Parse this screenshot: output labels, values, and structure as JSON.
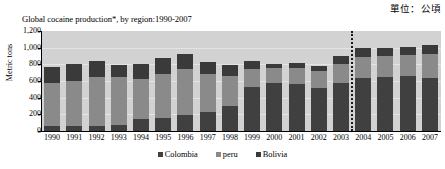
{
  "unit_note": "單位：公頃",
  "chart_data": {
    "type": "bar",
    "subtype": "stacked-bar",
    "title": "Global cocaine production*, by region:1990-2007",
    "xlabel": "",
    "ylabel": "Metric tons",
    "ylim": [
      0,
      1200
    ],
    "ytick_values": [
      0,
      200,
      400,
      600,
      800,
      1000,
      1200
    ],
    "ytick_labels": [
      "0",
      "200",
      "400",
      "600",
      "800",
      "1,000",
      "1,200"
    ],
    "grid": true,
    "legend_position": "bottom",
    "categories": [
      "1990",
      "1991",
      "1992",
      "1993",
      "1994",
      "1995",
      "1996",
      "1997",
      "1998",
      "1999",
      "2000",
      "2001",
      "2002",
      "2003",
      "2004",
      "2005",
      "2006",
      "2007"
    ],
    "series": [
      {
        "name": "Colombia",
        "color": "#404040",
        "values": [
          60,
          60,
          65,
          70,
          140,
          160,
          190,
          230,
          300,
          530,
          580,
          570,
          520,
          580,
          640,
          650,
          660,
          640
        ]
      },
      {
        "name": "peru",
        "color": "#8a8a8a",
        "values": [
          520,
          545,
          580,
          575,
          480,
          525,
          555,
          460,
          360,
          220,
          180,
          190,
          200,
          220,
          250,
          250,
          250,
          290
        ]
      },
      {
        "name": "Bolivia",
        "color": "#3a3a3a",
        "values": [
          190,
          200,
          195,
          145,
          180,
          190,
          175,
          140,
          130,
          90,
          50,
          60,
          60,
          100,
          110,
          100,
          100,
          100
        ]
      }
    ],
    "totals": [
      770,
      805,
      840,
      790,
      800,
      875,
      920,
      830,
      790,
      840,
      810,
      820,
      780,
      900,
      1000,
      1000,
      1010,
      1030
    ],
    "annotations": [
      {
        "type": "vertical-dotted-line",
        "name": "methodology-break-line",
        "between": [
          "2003",
          "2004"
        ]
      }
    ]
  },
  "legend": {
    "items": [
      {
        "label": "Colombia",
        "color": "#404040"
      },
      {
        "label": "peru",
        "color": "#8a8a8a"
      },
      {
        "label": "Bolivia",
        "color": "#3a3a3a"
      }
    ]
  }
}
